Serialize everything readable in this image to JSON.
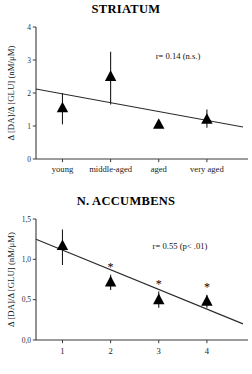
{
  "chart_data": [
    {
      "type": "scatter",
      "id": "striatum",
      "title": "STRIATUM",
      "xlabel": "",
      "ylabel": "Δ [DA]/Δ [GLU] (nM/μM)",
      "categories": [
        "young",
        "middle-aged",
        "aged",
        "very aged"
      ],
      "x": [
        1,
        2,
        3,
        4
      ],
      "values": [
        1.55,
        2.5,
        1.05,
        1.2
      ],
      "err_low": [
        0.5,
        0.85,
        0.1,
        0.25
      ],
      "err_high": [
        0.45,
        0.75,
        0.1,
        0.3
      ],
      "significance": [
        "",
        "",
        "",
        ""
      ],
      "yticks": [
        "0",
        "1",
        "2",
        "3",
        "4"
      ],
      "ytick_values": [
        0,
        1,
        2,
        3,
        4
      ],
      "ylim": [
        0,
        4
      ],
      "xlim": [
        0.45,
        4.75
      ],
      "grid": false,
      "marker": "triangle-up",
      "regression": {
        "x0": 0.45,
        "y0": 2.12,
        "x1": 4.75,
        "y1": 0.97
      },
      "annotation": "r= 0.14 (n.s.)",
      "annotation_r": "0.14",
      "annotation_p": "n.s."
    },
    {
      "type": "scatter",
      "id": "accumbens",
      "title": "N. ACCUMBENS",
      "xlabel": "",
      "ylabel": "Δ [DA]/Δ [GLU] (nM/μM)",
      "categories": [
        "1",
        "2",
        "3",
        "4"
      ],
      "x": [
        1,
        2,
        3,
        4
      ],
      "values": [
        1.17,
        0.72,
        0.5,
        0.48
      ],
      "err_low": [
        0.24,
        0.1,
        0.1,
        0.08
      ],
      "err_high": [
        0.2,
        0.09,
        0.1,
        0.08
      ],
      "significance": [
        "",
        "*",
        "*",
        "*"
      ],
      "yticks": [
        "0,0",
        "0,5",
        "1,0",
        "1,5"
      ],
      "ytick_values": [
        0,
        0.5,
        1.0,
        1.5
      ],
      "ylim": [
        0,
        1.5
      ],
      "xlim": [
        0.45,
        4.75
      ],
      "grid": false,
      "marker": "triangle-up",
      "regression": {
        "x0": 0.45,
        "y0": 1.25,
        "x1": 4.75,
        "y1": 0.2
      },
      "annotation": "r= 0.55 (p< .01)",
      "annotation_r": "0.55",
      "annotation_p": "p< .01"
    }
  ]
}
